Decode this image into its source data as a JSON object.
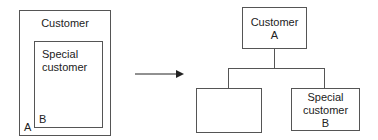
{
  "left_diagram": {
    "outer_box": {
      "label": "Customer",
      "corner_label": "A"
    },
    "inner_box": {
      "label_line1": "Special",
      "label_line2": "customer",
      "corner_label": "B"
    }
  },
  "arrow": {
    "direction": "right"
  },
  "right_diagram": {
    "parent_box": {
      "label_line1": "Customer",
      "label_line2": "A"
    },
    "child_left_box": {
      "label": ""
    },
    "child_right_box": {
      "label_line1": "Special",
      "label_line2": "customer",
      "label_line3": "B"
    }
  },
  "colors": {
    "stroke": "#555555",
    "text": "#222222",
    "background": "#ffffff"
  }
}
